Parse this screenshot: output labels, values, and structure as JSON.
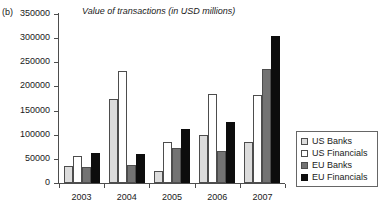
{
  "panel": {
    "label": "(b)"
  },
  "chart_data": {
    "type": "bar",
    "title": "Value of transactions (in USD millions)",
    "xlabel": "",
    "ylabel": "",
    "ylim": [
      0,
      350000
    ],
    "yticks": [
      0,
      50000,
      100000,
      150000,
      200000,
      250000,
      300000,
      350000
    ],
    "ytick_labels": [
      "0",
      "50000",
      "100000",
      "150000",
      "200000",
      "250000",
      "300000",
      "350000"
    ],
    "grid": false,
    "legend_position": "right",
    "categories": [
      "2003",
      "2004",
      "2005",
      "2006",
      "2007"
    ],
    "series": [
      {
        "name": "US Banks",
        "color": "#dcdcdc",
        "values": [
          35000,
          174000,
          25000,
          100000,
          84000
        ]
      },
      {
        "name": "US Financials",
        "color": "#ffffff",
        "values": [
          56000,
          232000,
          85000,
          185000,
          182000
        ]
      },
      {
        "name": "EU Banks",
        "color": "#737373",
        "values": [
          34000,
          37000,
          72000,
          66000,
          237000
        ]
      },
      {
        "name": "EU Financials",
        "color": "#0d0d0d",
        "values": [
          63000,
          61000,
          111000,
          126000,
          305000
        ]
      }
    ]
  }
}
